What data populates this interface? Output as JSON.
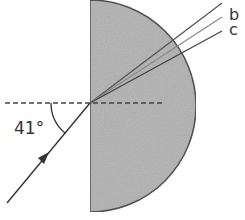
{
  "diagram": {
    "type": "refraction-semicircular-block",
    "angle_label": "41°",
    "ray_labels": [
      "a",
      "b",
      "c"
    ],
    "visible_ray_labels": [
      "b",
      "c"
    ],
    "colors": {
      "block_fill": "#b8b8b8",
      "block_stroke": "#555555",
      "line": "#333333",
      "ray_b": "#888888"
    }
  }
}
